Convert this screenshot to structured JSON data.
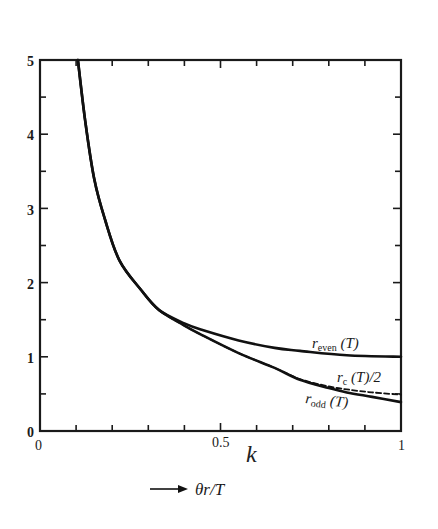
{
  "chart_data": {
    "type": "line",
    "title": "",
    "xlabel": "θr/T",
    "ylabel": "",
    "xlim": [
      0,
      1
    ],
    "ylim": [
      0,
      5
    ],
    "x_ticks": [
      "0",
      "0.5",
      "1"
    ],
    "y_ticks": [
      "0",
      "1",
      "2",
      "3",
      "4",
      "5"
    ],
    "grid": false,
    "legend": "inline labels at right end of curves",
    "series": [
      {
        "name": "r_even (T)",
        "style": "solid",
        "points": [
          [
            0.105,
            5.0
          ],
          [
            0.125,
            4.19
          ],
          [
            0.15,
            3.4
          ],
          [
            0.18,
            2.85
          ],
          [
            0.22,
            2.3
          ],
          [
            0.28,
            1.9
          ],
          [
            0.33,
            1.63
          ],
          [
            0.4,
            1.45
          ],
          [
            0.45,
            1.36
          ],
          [
            0.55,
            1.22
          ],
          [
            0.65,
            1.12
          ],
          [
            0.72,
            1.08
          ],
          [
            0.85,
            1.02
          ],
          [
            1.0,
            1.0
          ]
        ]
      },
      {
        "name": "r_c (T)/2",
        "style": "dashed",
        "points": [
          [
            0.105,
            5.0
          ],
          [
            0.125,
            4.19
          ],
          [
            0.15,
            3.4
          ],
          [
            0.18,
            2.85
          ],
          [
            0.22,
            2.3
          ],
          [
            0.28,
            1.9
          ],
          [
            0.33,
            1.63
          ],
          [
            0.4,
            1.42
          ],
          [
            0.45,
            1.29
          ],
          [
            0.55,
            1.05
          ],
          [
            0.65,
            0.85
          ],
          [
            0.72,
            0.7
          ],
          [
            0.8,
            0.6
          ],
          [
            0.85,
            0.56
          ],
          [
            0.92,
            0.52
          ],
          [
            1.0,
            0.49
          ]
        ]
      },
      {
        "name": "r_odd (T)",
        "style": "solid",
        "points": [
          [
            0.105,
            5.0
          ],
          [
            0.125,
            4.19
          ],
          [
            0.15,
            3.4
          ],
          [
            0.18,
            2.85
          ],
          [
            0.22,
            2.3
          ],
          [
            0.28,
            1.9
          ],
          [
            0.33,
            1.63
          ],
          [
            0.4,
            1.42
          ],
          [
            0.45,
            1.29
          ],
          [
            0.55,
            1.05
          ],
          [
            0.65,
            0.85
          ],
          [
            0.72,
            0.69
          ],
          [
            0.8,
            0.58
          ],
          [
            0.85,
            0.52
          ],
          [
            0.92,
            0.46
          ],
          [
            1.0,
            0.39
          ]
        ]
      }
    ],
    "annotations": [
      "r_even (T)",
      "r_c (T)/2",
      "r_odd (T)",
      "→ θr/T"
    ]
  },
  "labels": {
    "y": [
      "0",
      "1",
      "2",
      "3",
      "4",
      "5"
    ],
    "x0": "0",
    "x_half": "0.5",
    "x1": "1",
    "y0": "0",
    "r_even": "r",
    "r_even_sub": "even",
    "r_even_arg": " (T)",
    "r_c": "r",
    "r_c_sub": "c",
    "r_c_arg": " (T)/2",
    "r_odd": "r",
    "r_odd_sub": "odd",
    "r_odd_arg": " (T)",
    "x_axis": "θr/T",
    "handwritten_mark": "k"
  }
}
